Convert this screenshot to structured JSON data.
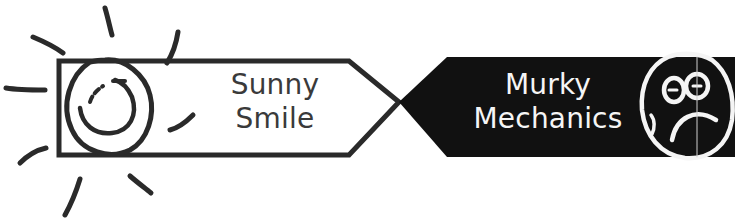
{
  "left_panel": {
    "line1": "Sunny",
    "line2": "Smile",
    "icon": "sun-smiley-icon",
    "fill": "#ffffff",
    "stroke": "#2a2a2a"
  },
  "right_panel": {
    "line1": "Murky",
    "line2": "Mechanics",
    "icon": "sad-face-icon",
    "fill": "#111111",
    "text_color": "#f5f5f5"
  }
}
